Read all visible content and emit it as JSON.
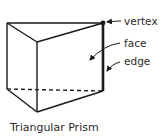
{
  "diagram": {
    "caption": "Triangular Prism",
    "labels": {
      "vertex": "vertex",
      "face": "face",
      "edge": "edge"
    },
    "colors": {
      "stroke": "#1a1a1a",
      "text": "#2a2a2a",
      "background": "#ffffff"
    }
  }
}
